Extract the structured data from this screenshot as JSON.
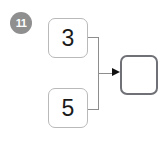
{
  "diagram": {
    "step_badge": {
      "label": "11",
      "color": "#8f8f8f",
      "text_color": "#ffffff"
    },
    "nodes": [
      {
        "id": "input-top",
        "label": "3",
        "border_color": "#b9b9b9"
      },
      {
        "id": "input-bottom",
        "label": "5",
        "border_color": "#b9b9b9"
      },
      {
        "id": "output",
        "label": "",
        "border_color": "#6f7176"
      }
    ],
    "connectors": [
      {
        "from": "input-top",
        "to": "output",
        "style": "elbow"
      },
      {
        "from": "input-bottom",
        "to": "output",
        "style": "elbow"
      }
    ],
    "arrow_color": "#111111",
    "wire_color": "#8d8d8d",
    "background": "#ffffff"
  }
}
